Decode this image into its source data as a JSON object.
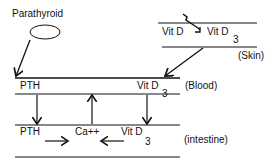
{
  "diagram": {
    "gland_label": "Parathyroid",
    "skin": {
      "precursor": "Vit D",
      "product": "Vit D",
      "product_sub": "3",
      "label": "(Skin)"
    },
    "blood": {
      "hormone": "PTH",
      "vitamin": "Vit D",
      "vitamin_sub": "3",
      "label": "(Blood)"
    },
    "intestine": {
      "hormone": "PTH",
      "ion": "Ca++",
      "vitamin": "Vit D",
      "vitamin_sub": "3",
      "label": "(intestine)"
    },
    "colors": {
      "ink": "#111111",
      "background": "#ffffff"
    }
  }
}
